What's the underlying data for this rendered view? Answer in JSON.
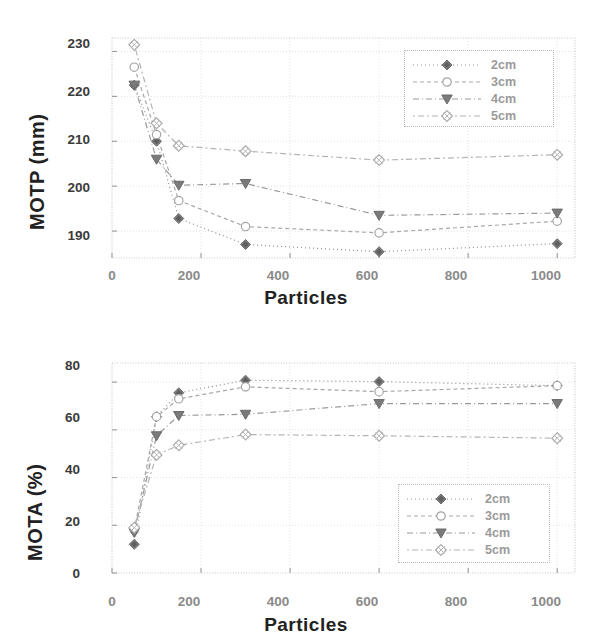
{
  "figure": {
    "series_colors": [
      "#8f8f8f",
      "#a8a8a8",
      "#9a9a9a",
      "#b4b4b4"
    ],
    "frame_color": "#c9c9c9",
    "grid_color": "#e2e2e2"
  },
  "charts": [
    {
      "id": "motp-chart",
      "ylabel": "MOTP (mm)",
      "xlabel": "Particles",
      "yticks": [
        "190",
        "200",
        "210",
        "220",
        "230"
      ],
      "xticks": [
        "0",
        "200",
        "400",
        "600",
        "800",
        "1000"
      ],
      "legend": [
        "2cm",
        "3cm",
        "4cm",
        "5cm"
      ]
    },
    {
      "id": "mota-chart",
      "ylabel": "MOTA (%)",
      "xlabel": "Particles",
      "yticks": [
        "0",
        "20",
        "40",
        "60",
        "80"
      ],
      "xticks": [
        "0",
        "200",
        "400",
        "600",
        "800",
        "1000"
      ],
      "legend": [
        "2cm",
        "3cm",
        "4cm",
        "5cm"
      ]
    }
  ],
  "chart_data": [
    {
      "type": "line",
      "title": "",
      "xlabel": "Particles",
      "ylabel": "MOTP (mm)",
      "xlim": [
        0,
        1040
      ],
      "ylim": [
        184,
        233
      ],
      "xticks": [
        0,
        200,
        400,
        600,
        800,
        1000
      ],
      "yticks": [
        190,
        200,
        210,
        220,
        230
      ],
      "grid": true,
      "legend_position": "upper right",
      "x": [
        50,
        100,
        150,
        300,
        600,
        1000
      ],
      "series": [
        {
          "name": "2cm",
          "marker": "filled-diamond",
          "values": [
            222.5,
            210.0,
            192.8,
            187.0,
            185.4,
            187.2
          ]
        },
        {
          "name": "3cm",
          "marker": "open-circle",
          "values": [
            226.5,
            211.5,
            196.8,
            191.0,
            189.6,
            192.2
          ]
        },
        {
          "name": "4cm",
          "marker": "filled-triangle-down",
          "values": [
            222.5,
            206.0,
            200.2,
            200.6,
            193.5,
            194.0
          ]
        },
        {
          "name": "5cm",
          "marker": "open-diamond",
          "values": [
            231.5,
            214.0,
            209.0,
            207.8,
            205.8,
            207.0
          ]
        }
      ]
    },
    {
      "type": "line",
      "title": "",
      "xlabel": "Particles",
      "ylabel": "MOTA (%)",
      "xlim": [
        0,
        1040
      ],
      "ylim": [
        0,
        88
      ],
      "xticks": [
        0,
        200,
        400,
        600,
        800,
        1000
      ],
      "yticks": [
        0,
        20,
        40,
        60,
        80
      ],
      "grid": true,
      "legend_position": "lower right",
      "x": [
        50,
        100,
        150,
        300,
        600,
        1000
      ],
      "series": [
        {
          "name": "2cm",
          "marker": "filled-diamond",
          "values": [
            12.0,
            65.5,
            75.5,
            80.8,
            80.2,
            78.5
          ]
        },
        {
          "name": "3cm",
          "marker": "open-circle",
          "values": [
            18.0,
            65.5,
            73.0,
            78.0,
            76.0,
            78.5
          ]
        },
        {
          "name": "4cm",
          "marker": "filled-triangle-down",
          "values": [
            17.0,
            57.5,
            66.0,
            66.5,
            71.0,
            71.0
          ]
        },
        {
          "name": "5cm",
          "marker": "open-diamond",
          "values": [
            19.0,
            49.5,
            53.5,
            58.0,
            57.5,
            56.5
          ]
        }
      ]
    }
  ]
}
